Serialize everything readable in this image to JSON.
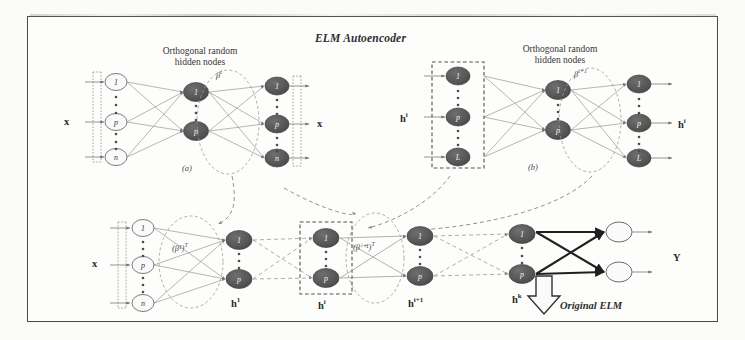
{
  "figure": {
    "title": "ELM Autoencoder",
    "border_color": "#4a4a4a",
    "background": "#fdfdfc",
    "node_dark_color": "#585858",
    "node_light_color": "#ffffff",
    "edge_color": "#7a7a7a",
    "dashed_box_color": "#555555",
    "width": 745,
    "height": 340
  },
  "panel_a": {
    "caption": "(a)",
    "header": "Orthogonal random\nhidden nodes",
    "header_line1": "Orthogonal random",
    "header_line2": "hidden nodes",
    "input_label": "x",
    "output_label": "x",
    "weight_label": "β",
    "weight_superscript": "i",
    "input_nodes": [
      "1",
      "p",
      "n"
    ],
    "hidden_nodes": [
      "1",
      "p"
    ],
    "output_nodes": [
      "1",
      "p",
      "n"
    ]
  },
  "panel_b": {
    "caption": "(b)",
    "header_line1": "Orthogonal random",
    "header_line2": "hidden nodes",
    "input_label": "h",
    "input_superscript": "i",
    "output_label": "h",
    "output_superscript": "i",
    "weight_label": "β",
    "weight_superscript": "i+1",
    "input_nodes": [
      "1",
      "p",
      "L"
    ],
    "hidden_nodes": [
      "1",
      "p"
    ],
    "output_nodes": [
      "1",
      "p",
      "L"
    ]
  },
  "stacked": {
    "input_label": "x",
    "input_nodes": [
      "1",
      "p",
      "n"
    ],
    "layer1_nodes": [
      "1",
      "p"
    ],
    "layer1_label": "h",
    "layer1_superscript": "1",
    "layer1_weight": "(β¹)",
    "layer1_weight_sup": "T",
    "layer_i_nodes": [
      "1",
      "p"
    ],
    "layer_i_label": "h",
    "layer_i_superscript": "i",
    "layer_i1_nodes": [
      "1",
      "p"
    ],
    "layer_i1_label": "h",
    "layer_i1_superscript": "i+1",
    "layer_i1_weight": "(βⁱ⁺¹)",
    "layer_i1_weight_sup": "T",
    "layer_k_nodes": [
      "1",
      "p"
    ],
    "layer_k_label": "h",
    "layer_k_superscript": "k",
    "output_nodes": [
      "",
      ""
    ],
    "output_label": "Y",
    "annotation": "Original ELM"
  }
}
